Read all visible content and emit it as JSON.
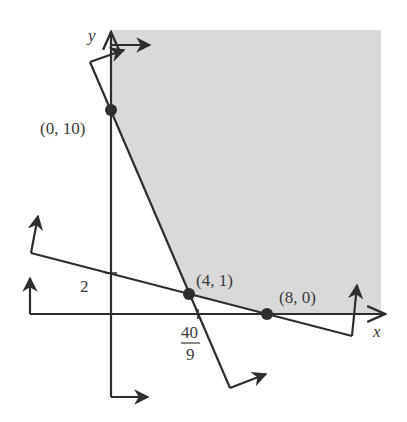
{
  "figure": {
    "type": "feasible-region-graph",
    "axes": {
      "x_label": "x",
      "y_label": "y"
    },
    "tick_labels": {
      "y_intercept_line2": "2",
      "x_intercept_line1_num": "40",
      "x_intercept_line1_den": "9"
    },
    "points": [
      {
        "label": "(0, 10)",
        "x": 0,
        "y": 10
      },
      {
        "label": "(4, 1)",
        "x": 4,
        "y": 1
      },
      {
        "label": "(8, 0)",
        "x": 8,
        "y": 0
      }
    ],
    "lines": [
      {
        "name": "steep-constraint",
        "through": [
          [
            0,
            10
          ],
          [
            4,
            1
          ]
        ],
        "x_intercept": "40/9"
      },
      {
        "name": "shallow-constraint",
        "through": [
          [
            4,
            1
          ],
          [
            8,
            0
          ]
        ],
        "y_intercept": 2
      }
    ],
    "shaded_region": "feasible region (unbounded, upper right)",
    "colors": {
      "shade": "#d9d9d9",
      "ink": "#2e2e2e",
      "background": "#ffffff"
    }
  }
}
